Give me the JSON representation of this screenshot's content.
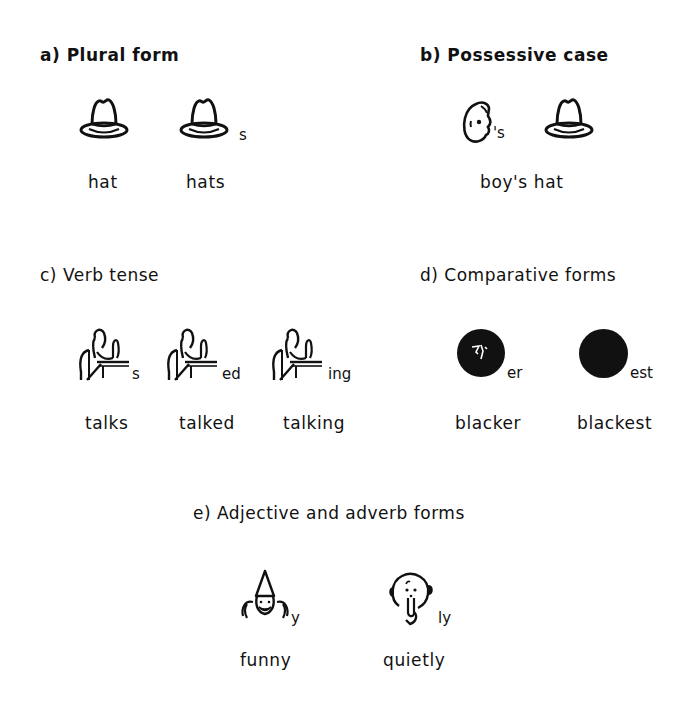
{
  "sections": {
    "a": {
      "title": "a) Plural form",
      "symbols": [
        {
          "icon": "hat-icon",
          "suffix": "",
          "label": "hat"
        },
        {
          "icon": "hat-icon",
          "suffix": "s",
          "label": "hats"
        }
      ]
    },
    "b": {
      "title": "b) Possessive case",
      "symbols": [
        {
          "icon": "boy-head-icon",
          "suffix": "'s"
        },
        {
          "icon": "hat-icon",
          "suffix": ""
        }
      ],
      "label": "boy's hat"
    },
    "c": {
      "title": "c) Verb tense",
      "symbols": [
        {
          "icon": "person-talking-icon",
          "suffix": "s",
          "label": "talks"
        },
        {
          "icon": "person-talking-icon",
          "suffix": "ed",
          "label": "talked"
        },
        {
          "icon": "person-talking-icon",
          "suffix": "ing",
          "label": "talking"
        }
      ]
    },
    "d": {
      "title": "d) Comparative forms",
      "symbols": [
        {
          "icon": "black-circle-icon",
          "suffix": "er",
          "label": "blacker"
        },
        {
          "icon": "black-circle-icon",
          "suffix": "est",
          "label": "blackest"
        }
      ]
    },
    "e": {
      "title": "e) Adjective and adverb forms",
      "symbols": [
        {
          "icon": "clown-icon",
          "suffix": "y",
          "label": "funny"
        },
        {
          "icon": "quiet-face-icon",
          "suffix": "ly",
          "label": "quietly"
        }
      ]
    }
  },
  "colors": {
    "ink": "#111111",
    "background": "#ffffff"
  }
}
